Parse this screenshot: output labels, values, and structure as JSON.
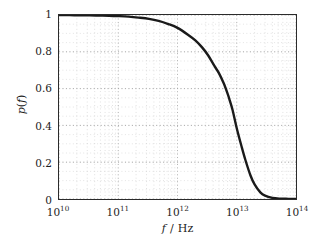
{
  "chart_data": {
    "type": "line",
    "title": "",
    "subtitle": "",
    "xlabel": "f / Hz",
    "xlabel_parts": {
      "symbol": "f",
      "separator": "/",
      "unit": "Hz"
    },
    "ylabel": "p(f)",
    "ylabel_parts": {
      "symbol": "p",
      "open": "(",
      "arg": "f",
      "close": ")"
    },
    "xscale": "log",
    "yscale": "linear",
    "xlim": [
      10000000000.0,
      100000000000000.0
    ],
    "ylim": [
      0,
      1
    ],
    "xticks": [
      10000000000.0,
      100000000000.0,
      1000000000000.0,
      10000000000000.0,
      100000000000000.0
    ],
    "xtick_labels": [
      "10^10",
      "10^11",
      "10^12",
      "10^13",
      "10^14"
    ],
    "xtick_mantissa": [
      "10",
      "10",
      "10",
      "10",
      "10"
    ],
    "xtick_exponents": [
      "10",
      "11",
      "12",
      "13",
      "14"
    ],
    "yticks": [
      0,
      0.2,
      0.4,
      0.6,
      0.8,
      1
    ],
    "ytick_labels": [
      "0",
      "0.2",
      "0.4",
      "0.6",
      "0.8",
      "1"
    ],
    "grid": "both-minor-and-major-dotted",
    "grid_color": "#c8c8c8",
    "grid_major_color": "#9a9a9a",
    "legend": "none",
    "line_color": "#1a1a1a",
    "line_width": 2.4,
    "frame_color": "#2b2b2b",
    "background": "#ffffff",
    "series": [
      {
        "name": "p(f)",
        "x": [
          10000000000.0,
          15000000000.0,
          22000000000.0,
          33000000000.0,
          48000000000.0,
          70000000000.0,
          100000000000.0,
          150000000000.0,
          220000000000.0,
          330000000000.0,
          480000000000.0,
          700000000000.0,
          1000000000000.0,
          1500000000000.0,
          2000000000000.0,
          2600000000000.0,
          3300000000000.0,
          4200000000000.0,
          5000000000000.0,
          6000000000000.0,
          7000000000000.0,
          7500000000000.0,
          8500000000000.0,
          10000000000000.0,
          12000000000000.0,
          14000000000000.0,
          17000000000000.0,
          20000000000000.0,
          25000000000000.0,
          30000000000000.0,
          40000000000000.0,
          55000000000000.0,
          75000000000000.0,
          100000000000000.0
        ],
        "y": [
          1.0,
          0.999,
          0.999,
          0.998,
          0.997,
          0.996,
          0.994,
          0.991,
          0.986,
          0.979,
          0.968,
          0.951,
          0.93,
          0.893,
          0.862,
          0.824,
          0.78,
          0.723,
          0.684,
          0.63,
          0.573,
          0.543,
          0.484,
          0.385,
          0.288,
          0.212,
          0.129,
          0.079,
          0.036,
          0.018,
          0.006,
          0.002,
          0.001,
          0.0
        ]
      }
    ],
    "annotations": []
  }
}
